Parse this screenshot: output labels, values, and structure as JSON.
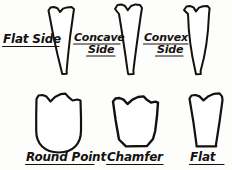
{
  "figure": {
    "background_color": "#fdfdfc",
    "ink_color": "#14120f",
    "style": "hand-drawn line illustration"
  },
  "rows": [
    {
      "row_name": "side-profiles",
      "items": [
        {
          "key": "flat-side",
          "label_lines": [
            "Flat Side"
          ],
          "underlined": true
        },
        {
          "key": "concave-side",
          "label_lines": [
            "Concave",
            "Side"
          ],
          "underlined": true
        },
        {
          "key": "convex-side",
          "label_lines": [
            "Convex",
            "Side"
          ],
          "underlined": true
        }
      ]
    },
    {
      "row_name": "end-profiles",
      "items": [
        {
          "key": "round-point",
          "label_lines": [
            "Round Point"
          ],
          "underlined": true
        },
        {
          "key": "chamfer",
          "label_lines": [
            "Chamfer"
          ],
          "underlined": true
        },
        {
          "key": "flat",
          "label_lines": [
            "Flat"
          ],
          "underlined": true
        }
      ]
    }
  ],
  "labels": {
    "flat_side": "Flat Side",
    "concave_line1": "Concave",
    "concave_line2": "Side",
    "convex_line1": "Convex",
    "convex_line2": "Side",
    "round_point": "Round Point",
    "chamfer": "Chamfer",
    "flat": "Flat"
  }
}
